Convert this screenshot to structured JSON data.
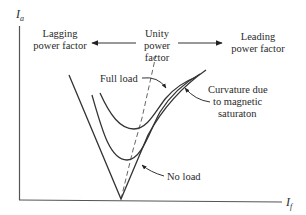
{
  "diagram": {
    "axes": {
      "y_label_main": "I",
      "y_label_sub": "a",
      "x_label_main": "I",
      "x_label_sub": "f"
    },
    "annotations": {
      "lagging_line1": "Lagging",
      "lagging_line2": "power factor",
      "unity_line1": "Unity",
      "unity_line2": "power",
      "unity_line3": "factor",
      "leading_line1": "Leading",
      "leading_line2": "power factor",
      "full_load": "Full load",
      "no_load": "No load",
      "curvature_line1": "Curvature due",
      "curvature_line2": "to magnetic",
      "curvature_line3": "saturaton"
    },
    "curves": [
      {
        "name": "No load"
      },
      {
        "name": "Intermediate load"
      },
      {
        "name": "Full load"
      }
    ],
    "reference_line": "Unity power factor locus (dashed)"
  }
}
